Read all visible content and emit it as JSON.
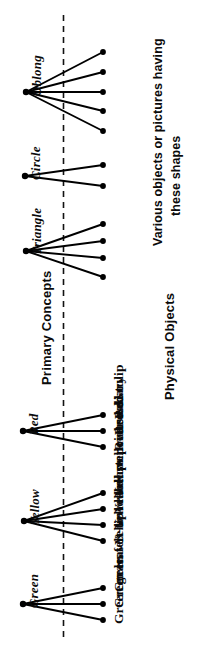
{
  "diagram": {
    "title_left": "Primary Concepts",
    "title_right": "Physical Objects",
    "caption_line1": "Various objects or pictures having",
    "caption_line2": "these shapes",
    "divider": "vertical-dashed-line",
    "ink_color": "#000000",
    "background_color": "#ffffff",
    "groups": [
      {
        "concept": "Oblong",
        "node": {
          "x": 26,
          "y": 92
        },
        "objects": [
          {
            "label": "",
            "x": 103,
            "y": 52
          },
          {
            "label": "",
            "x": 103,
            "y": 72
          },
          {
            "label": "",
            "x": 103,
            "y": 92
          },
          {
            "label": "",
            "x": 103,
            "y": 111
          },
          {
            "label": "",
            "x": 103,
            "y": 131
          }
        ]
      },
      {
        "concept": "Circle",
        "node": {
          "x": 25,
          "y": 176
        },
        "objects": [
          {
            "label": "",
            "x": 103,
            "y": 165
          },
          {
            "label": "",
            "x": 103,
            "y": 186
          }
        ]
      },
      {
        "concept": "Triangle",
        "node": {
          "x": 26,
          "y": 251
        },
        "objects": [
          {
            "label": "",
            "x": 103,
            "y": 224
          },
          {
            "label": "",
            "x": 103,
            "y": 241
          },
          {
            "label": "",
            "x": 103,
            "y": 258
          },
          {
            "label": "",
            "x": 103,
            "y": 277
          }
        ]
      },
      {
        "concept": "Red",
        "node": {
          "x": 23,
          "y": 431
        },
        "objects": [
          {
            "label": "Red tulip",
            "x": 103,
            "y": 415
          },
          {
            "label": "Red diary",
            "x": 103,
            "y": 431
          },
          {
            "label": "Red socks",
            "x": 103,
            "y": 447
          }
        ]
      },
      {
        "concept": "Yellow",
        "node": {
          "x": 24,
          "y": 521
        },
        "objects": [
          {
            "label": "Yellow primrose",
            "x": 103,
            "y": 493
          },
          {
            "label": "Yellow pullover",
            "x": 103,
            "y": 509
          },
          {
            "label": "Yellow duster",
            "x": 103,
            "y": 525
          },
          {
            "label": "Yellow label",
            "x": 103,
            "y": 541
          }
        ]
      },
      {
        "concept": "Green",
        "node": {
          "x": 23,
          "y": 604
        },
        "objects": [
          {
            "label": "Green felt-tip",
            "x": 103,
            "y": 588
          },
          {
            "label": "Green leaves",
            "x": 103,
            "y": 604
          },
          {
            "label": "Green grass",
            "x": 103,
            "y": 620
          }
        ]
      }
    ]
  }
}
